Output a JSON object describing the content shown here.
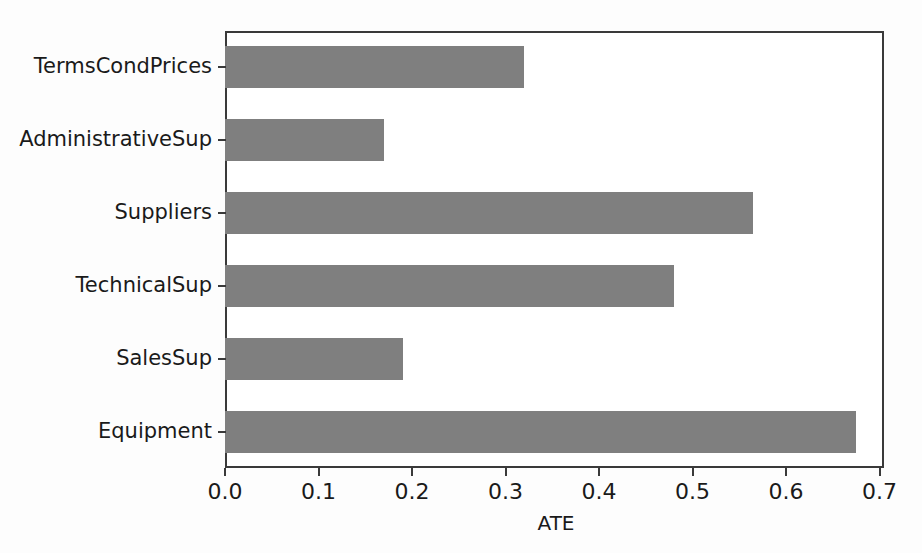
{
  "chart_data": {
    "type": "bar",
    "orientation": "horizontal",
    "title": "",
    "xlabel": "ATE",
    "ylabel": "",
    "categories": [
      "Equipment",
      "SalesSup",
      "TechnicalSup",
      "Suppliers",
      "AdministrativeSup",
      "TermsCondPrices"
    ],
    "values": [
      0.675,
      0.19,
      0.48,
      0.565,
      0.17,
      0.32
    ],
    "bars": [
      {
        "label": "TermsCondPrices",
        "value": 0.32
      },
      {
        "label": "AdministrativeSup",
        "value": 0.17
      },
      {
        "label": "Suppliers",
        "value": 0.565
      },
      {
        "label": "TechnicalSup",
        "value": 0.48
      },
      {
        "label": "SalesSup",
        "value": 0.19
      },
      {
        "label": "Equipment",
        "value": 0.675
      }
    ],
    "xlim": [
      0.0,
      0.7047
    ],
    "xticks": [
      0.0,
      0.1,
      0.2,
      0.3,
      0.4,
      0.5,
      0.6,
      0.7
    ],
    "xticklabels": [
      "0.0",
      "0.1",
      "0.2",
      "0.3",
      "0.4",
      "0.5",
      "0.6",
      "0.7"
    ],
    "grid": false,
    "legend": false,
    "bar_color": "#7f7f7f",
    "axis_color": "#3a3a3a",
    "text_color": "#1a1a1a",
    "background_color": "#ffffff"
  }
}
